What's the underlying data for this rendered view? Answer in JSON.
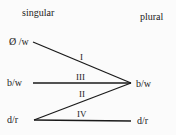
{
  "headers": {
    "left": "singular",
    "right": "plural"
  },
  "nodes": {
    "left_top": "Ø /w",
    "left_mid": "b/w",
    "left_bottom": "d/r",
    "right_mid": "b/w",
    "right_bottom": "d/r"
  },
  "edges": [
    {
      "id": "I",
      "label": "I",
      "from": "Ø /w",
      "to": "b/w"
    },
    {
      "id": "III",
      "label": "III",
      "from": "b/w",
      "to": "b/w"
    },
    {
      "id": "II",
      "label": "II",
      "from": "d/r",
      "to": "b/w"
    },
    {
      "id": "IV",
      "label": "IV",
      "from": "d/r",
      "to": "d/r"
    }
  ],
  "colors": {
    "line": "#1a1a1a",
    "text": "#222222",
    "background": "#fbfbfb"
  }
}
